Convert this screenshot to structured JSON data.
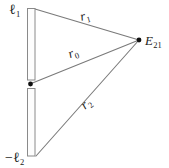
{
  "figure": {
    "type": "geometry-diagram",
    "background_color": "#ffffff",
    "stroke_color": "#7a7a7a",
    "text_color": "#1a1a1a",
    "fill_color": "#fdfdfd"
  },
  "labels": {
    "ell1": {
      "base": "ℓ",
      "sub": "1",
      "full": "ℓ1"
    },
    "ell2": {
      "base": "−ℓ",
      "sub": "2",
      "full": "−ℓ2"
    },
    "r1": {
      "base": "r",
      "sub": "1",
      "full": "r1"
    },
    "r0": {
      "base": "r",
      "sub": "0",
      "full": "r0"
    },
    "r2": {
      "base": "r",
      "sub": "2",
      "full": "r2"
    },
    "E21": {
      "base": "E",
      "sub": "21",
      "full": "E21"
    }
  },
  "geometry": {
    "upper_bar": {
      "x": 27,
      "y": 8,
      "width": 8,
      "height": 72
    },
    "lower_bar": {
      "x": 27,
      "y": 88,
      "width": 8,
      "height": 68
    },
    "origin_point": {
      "x": 30,
      "y": 84,
      "radius": 2.4
    },
    "vertex_point": {
      "x": 139,
      "y": 40,
      "radius": 2.4
    },
    "rays": [
      {
        "name": "r1",
        "x1": 35,
        "y1": 9,
        "x2": 139,
        "y2": 40
      },
      {
        "name": "r0",
        "x1": 30,
        "y1": 84,
        "x2": 139,
        "y2": 40
      },
      {
        "name": "r2",
        "x1": 36,
        "y1": 156,
        "x2": 139,
        "y2": 40
      }
    ]
  }
}
